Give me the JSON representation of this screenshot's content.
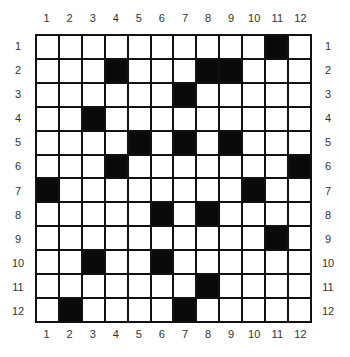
{
  "puzzle": {
    "rows": 12,
    "cols": 12,
    "col_labels": [
      "1",
      "2",
      "3",
      "4",
      "5",
      "6",
      "7",
      "8",
      "9",
      "10",
      "11",
      "12"
    ],
    "row_labels": [
      "1",
      "2",
      "3",
      "4",
      "5",
      "6",
      "7",
      "8",
      "9",
      "10",
      "11",
      "12"
    ],
    "black_cells": [
      [
        1,
        11
      ],
      [
        2,
        4
      ],
      [
        2,
        8
      ],
      [
        2,
        9
      ],
      [
        3,
        7
      ],
      [
        4,
        3
      ],
      [
        5,
        5
      ],
      [
        5,
        7
      ],
      [
        5,
        9
      ],
      [
        6,
        4
      ],
      [
        6,
        12
      ],
      [
        7,
        1
      ],
      [
        7,
        10
      ],
      [
        8,
        6
      ],
      [
        8,
        8
      ],
      [
        9,
        11
      ],
      [
        10,
        3
      ],
      [
        10,
        6
      ],
      [
        11,
        8
      ],
      [
        12,
        2
      ],
      [
        12,
        7
      ]
    ],
    "colors": {
      "black": "#0a0a0a",
      "white": "#ffffff",
      "line": "#111111"
    }
  }
}
